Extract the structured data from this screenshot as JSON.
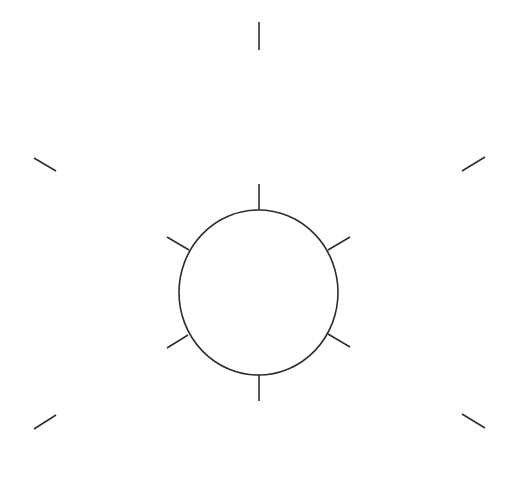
{
  "diagram": {
    "width": 512,
    "height": 493,
    "background": "#ffffff",
    "stroke_color": "#2e2e2e",
    "stroke_width": 1.6,
    "circle": {
      "cx": 258.5,
      "cy": 292.5,
      "rx": 79.5,
      "ry": 82.5
    },
    "inner_ticks": [
      {
        "name": "top",
        "x1": 259,
        "y1": 184,
        "x2": 259,
        "y2": 210
      },
      {
        "name": "upper-right",
        "x1": 328,
        "y1": 250,
        "x2": 350,
        "y2": 237
      },
      {
        "name": "lower-right",
        "x1": 328,
        "y1": 334,
        "x2": 350,
        "y2": 347
      },
      {
        "name": "bottom",
        "x1": 259,
        "y1": 375,
        "x2": 259,
        "y2": 401
      },
      {
        "name": "lower-left",
        "x1": 188,
        "y1": 335,
        "x2": 167,
        "y2": 348
      },
      {
        "name": "upper-left",
        "x1": 189,
        "y1": 250,
        "x2": 167,
        "y2": 237
      }
    ],
    "outer_ticks": [
      {
        "name": "top",
        "x1": 259,
        "y1": 22,
        "x2": 259,
        "y2": 50
      },
      {
        "name": "upper-right",
        "x1": 462,
        "y1": 171,
        "x2": 485,
        "y2": 157
      },
      {
        "name": "lower-right",
        "x1": 462,
        "y1": 414,
        "x2": 485,
        "y2": 428
      },
      {
        "name": "lower-left",
        "x1": 56,
        "y1": 415,
        "x2": 34,
        "y2": 429
      },
      {
        "name": "upper-left",
        "x1": 56,
        "y1": 171,
        "x2": 34,
        "y2": 158
      }
    ]
  }
}
